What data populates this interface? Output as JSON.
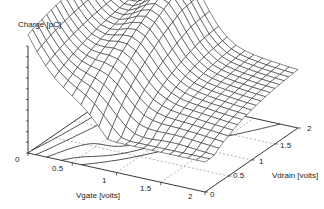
{
  "chart_data": {
    "type": "surface3d",
    "title": "",
    "zlabel": "Charge [pC]",
    "xlabel": "Vgate [volts]",
    "ylabel": "Vdrain [volts]",
    "x_ticks": [
      "0",
      "0.5",
      "1",
      "1.5",
      "2"
    ],
    "y_ticks": [
      "0",
      "0.5",
      "1",
      "1.5",
      "2"
    ],
    "z_ticks_count": 10,
    "xlim": [
      0,
      2
    ],
    "ylim": [
      0,
      2
    ],
    "grid_resolution": [
      20,
      20
    ],
    "surface_style": "wireframe",
    "base_projection": "contour"
  },
  "colors": {
    "line": "#222222",
    "grid": "#666666",
    "background": "#ffffff"
  }
}
